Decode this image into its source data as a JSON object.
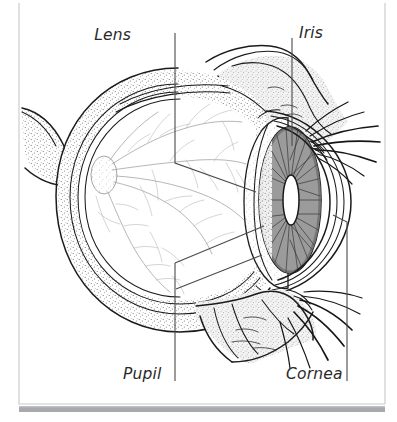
{
  "figure": {
    "view": "sagittal cross-section, facing right",
    "style": "black and white line drawing with stipple shading",
    "background_color": "#ffffff",
    "ink_color": "#1b1b1b",
    "label_color": "#2a2a2a",
    "frame_color": "#c9c9c9",
    "footer_bar_color": "#a7a9ac"
  },
  "labels": [
    {
      "id": "lens",
      "text": "Lens",
      "position": "top-left",
      "text_x": 131,
      "text_y": 40,
      "leader_path": "M175,33 L175,163 L256,192",
      "leader_kind": "vertical-then-diagonal"
    },
    {
      "id": "iris",
      "text": "Iris",
      "position": "top-right",
      "text_x": 299,
      "text_y": 38,
      "leader_path": "M292,38 L292,146",
      "leader_kind": "vertical"
    },
    {
      "id": "pupil",
      "text": "Pupil",
      "position": "bottom-left",
      "text_x": 123,
      "text_y": 379,
      "leader_path": "M175,263 L175,381",
      "leader_kind": "vertical"
    },
    {
      "id": "cornea",
      "text": "Cornea",
      "position": "bottom-right",
      "text_x": 286,
      "text_y": 379,
      "leader_path": "M333,215 L347,222 L347,381",
      "leader_kind": "diagonal-then-vertical"
    }
  ],
  "anatomy_parts": [
    "sclera",
    "choroid",
    "retina",
    "optic-disc",
    "retinal-blood-vessels",
    "vitreous-body",
    "lens",
    "iris",
    "pupil",
    "cornea",
    "anterior-chamber",
    "upper-eyelid",
    "lower-eyelid",
    "eyelashes",
    "extraocular-muscle"
  ],
  "frame": {
    "left": 19,
    "top": 3,
    "right": 385,
    "bottom": 404,
    "footer_bar": {
      "x": 19,
      "y": 406,
      "width": 366,
      "height": 6
    }
  }
}
